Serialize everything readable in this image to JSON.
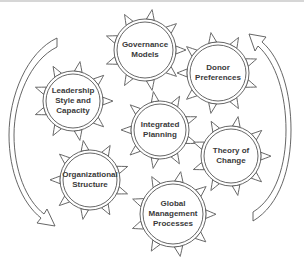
{
  "diagram": {
    "type": "gear-cycle",
    "stroke_color": "#555555",
    "text_color": "#3a3a3a",
    "background": "#ffffff",
    "gears": [
      {
        "id": "governance-models",
        "label_lines": [
          "Governance",
          "Models"
        ],
        "label": "Governance Models",
        "cx": 145,
        "cy": 50,
        "r": 28
      },
      {
        "id": "donor-preferences",
        "label_lines": [
          "Donor",
          "Preferences"
        ],
        "label": "Donor Preferences",
        "cx": 218,
        "cy": 73,
        "r": 28
      },
      {
        "id": "leadership-style-and-capacity",
        "label_lines": [
          "Leadership",
          "Style and",
          "Capacity"
        ],
        "label": "Leadership Style and Capacity",
        "cx": 73,
        "cy": 101,
        "r": 27
      },
      {
        "id": "integrated-planning",
        "label_lines": [
          "Integrated",
          "Planning"
        ],
        "label": "Integrated Planning",
        "cx": 160,
        "cy": 130,
        "r": 26
      },
      {
        "id": "theory-of-change",
        "label_lines": [
          "Theory of",
          "Change"
        ],
        "label": "Theory of Change",
        "cx": 231,
        "cy": 156,
        "r": 27
      },
      {
        "id": "organizational-structure",
        "label_lines": [
          "Organizational",
          "Structure"
        ],
        "label": "Organizational Structure",
        "cx": 90,
        "cy": 180,
        "r": 27
      },
      {
        "id": "global-management-processes",
        "label_lines": [
          "Global",
          "Management",
          "Processes"
        ],
        "label": "Global Management Processes",
        "cx": 173,
        "cy": 214,
        "r": 30
      }
    ],
    "arrows": [
      {
        "id": "left-cycle-arrow",
        "direction": "downward",
        "side": "left"
      },
      {
        "id": "right-cycle-arrow",
        "direction": "upward",
        "side": "right"
      }
    ]
  }
}
